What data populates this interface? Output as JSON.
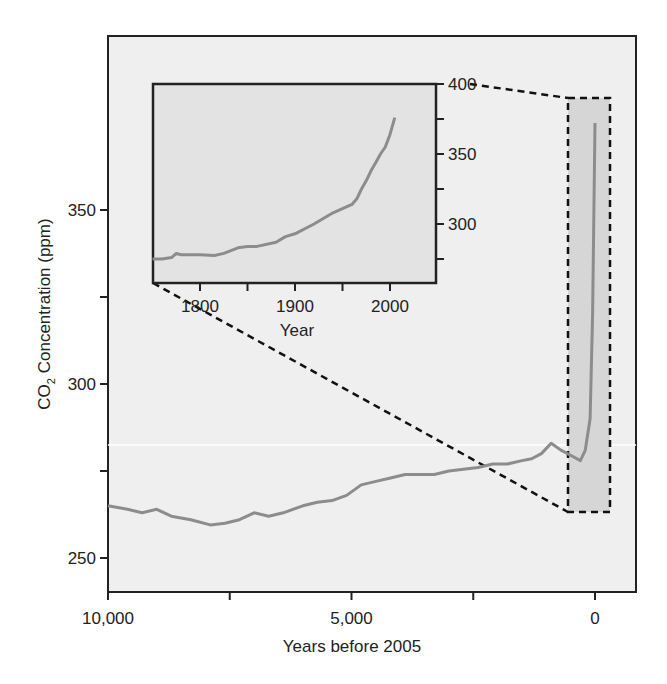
{
  "chart_data": [
    {
      "id": "main",
      "type": "line",
      "title": "",
      "xlabel": "Years before 2005",
      "ylabel": "CO2 Concentration (ppm)",
      "ylabel_parts": {
        "main": "CO",
        "sub": "2",
        "rest": " Concentration (ppm)"
      },
      "xlim": [
        10000,
        -800
      ],
      "ylim": [
        241,
        399
      ],
      "x_reversed": true,
      "grid": false,
      "legend": null,
      "x_ticks": [
        10000,
        7500,
        5000,
        2500,
        0
      ],
      "x_tick_labels": [
        "10,000",
        "",
        "5,000",
        "",
        "0"
      ],
      "y_ticks": [
        250,
        275,
        300,
        325,
        350
      ],
      "y_tick_labels": [
        "250",
        "",
        "300",
        "",
        "350"
      ],
      "background": "#efefef",
      "line_color": "#8c8c8c",
      "series": [
        {
          "name": "CO2 (ice core, Holocene)",
          "x": [
            10000,
            9600,
            9300,
            9000,
            8700,
            8300,
            7900,
            7600,
            7300,
            7000,
            6700,
            6400,
            6000,
            5700,
            5400,
            5100,
            4800,
            4500,
            4200,
            3900,
            3600,
            3300,
            3000,
            2700,
            2400,
            2100,
            1800,
            1500,
            1300,
            1100,
            900,
            700,
            500,
            300,
            200,
            100,
            50,
            0
          ],
          "y": [
            265,
            264,
            263,
            264,
            262,
            261,
            259.5,
            260,
            261,
            263,
            262,
            263,
            265,
            266,
            266.5,
            268,
            271,
            272,
            273,
            274,
            274,
            274,
            275,
            275.5,
            276,
            277,
            277,
            278,
            278.5,
            280,
            283,
            281,
            279.5,
            278,
            281,
            290,
            320,
            375
          ]
        }
      ],
      "annotations": [
        {
          "type": "shaded-box",
          "x_range": [
            600,
            -300
          ],
          "y_range": [
            263,
            381
          ],
          "style": "dashed",
          "label": "zoom region (inset)"
        }
      ]
    },
    {
      "id": "inset",
      "type": "line",
      "title": "",
      "xlabel": "Year",
      "ylabel": "",
      "xlim": [
        1750,
        2050
      ],
      "ylim": [
        255,
        400
      ],
      "y_axis_side": "right",
      "grid": false,
      "x_ticks": [
        1800,
        1850,
        1900,
        1950,
        2000
      ],
      "x_tick_labels": [
        "1800",
        "",
        "1900",
        "",
        "2000"
      ],
      "y_ticks": [
        275,
        300,
        325,
        350,
        375,
        400
      ],
      "y_tick_labels": [
        "",
        "300",
        "",
        "350",
        "",
        "400"
      ],
      "background": "#e3e3e3",
      "line_color": "#8c8c8c",
      "series": [
        {
          "name": "CO2 (1750–2005)",
          "x": [
            1750,
            1760,
            1770,
            1775,
            1780,
            1800,
            1815,
            1825,
            1840,
            1850,
            1860,
            1880,
            1890,
            1900,
            1920,
            1940,
            1950,
            1960,
            1965,
            1970,
            1975,
            1980,
            1985,
            1990,
            1995,
            2000,
            2005
          ],
          "y": [
            275,
            275,
            276,
            279,
            278,
            278,
            277.5,
            279,
            283,
            284,
            284,
            287,
            291,
            293,
            300,
            308,
            311,
            314,
            318,
            325,
            331,
            338,
            344,
            350,
            355,
            364,
            376
          ]
        }
      ]
    }
  ]
}
